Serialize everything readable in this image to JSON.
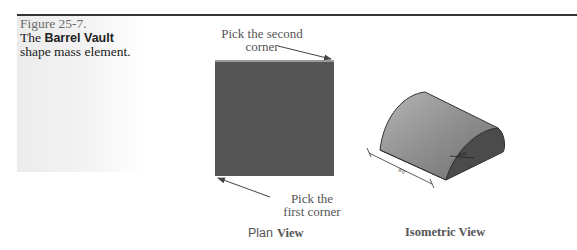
{
  "figure": {
    "number": "Figure 25-7.",
    "caption_prefix": "The",
    "caption_bold": "Barrel Vault",
    "caption_suffix": "shape mass element."
  },
  "plan_view": {
    "annotation_second_line1": "Pick the second",
    "annotation_second_line2": "corner",
    "annotation_first_line1": "Pick the",
    "annotation_first_line2": "first corner",
    "label_plain": "Plan",
    "label_bold": "View"
  },
  "isometric_view": {
    "label": "Isometric View",
    "dimension_length": "8'0\"",
    "dimension_radius": "4'0\""
  },
  "colors": {
    "plan_fill": "#555555",
    "vault_light": "#8a8a8a",
    "vault_dark": "#4a4a4a",
    "rule": "#333333"
  }
}
